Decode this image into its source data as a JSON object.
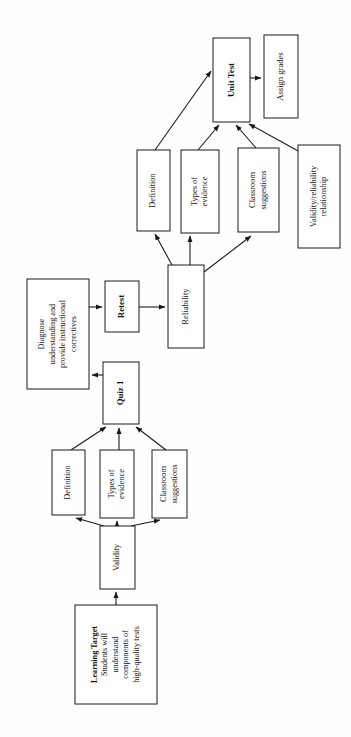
{
  "diagram": {
    "orientation": "rotated-90-counterclockwise",
    "style": {
      "box_fill": "#ffffff",
      "box_stroke": "#1a1a1a",
      "edge_color": "#1a1a1a",
      "text_color": "#111111",
      "page_background": "#fefefe"
    },
    "nodes": [
      {
        "id": "learning-target",
        "lines": [
          "Learning Target",
          "Students will",
          "understand",
          "components of",
          "high-quality tests"
        ],
        "bold_lines": [
          0
        ],
        "x": 75,
        "y": 605,
        "w": 82,
        "h": 99,
        "font_size": 8.2
      },
      {
        "id": "validity",
        "lines": [
          "Validity"
        ],
        "bold_lines": [],
        "x": 100,
        "y": 526,
        "w": 35,
        "h": 63,
        "font_size": 8.6
      },
      {
        "id": "definition-lower",
        "lines": [
          "Definition"
        ],
        "bold_lines": [],
        "x": 52,
        "y": 450,
        "w": 33,
        "h": 65,
        "font_size": 8.4
      },
      {
        "id": "types-of-evidence-lower",
        "lines": [
          "Types of",
          "evidence"
        ],
        "bold_lines": [],
        "x": 100,
        "y": 450,
        "w": 34,
        "h": 68,
        "font_size": 8.4
      },
      {
        "id": "classroom-suggestions-lower",
        "lines": [
          "Classroom",
          "suggestions"
        ],
        "bold_lines": [],
        "x": 152,
        "y": 450,
        "w": 35,
        "h": 68,
        "font_size": 8.4
      },
      {
        "id": "quiz-1",
        "lines": [
          "Quiz 1"
        ],
        "bold_lines": [
          0
        ],
        "x": 103,
        "y": 362,
        "w": 36,
        "h": 62,
        "font_size": 8.8
      },
      {
        "id": "diagnose",
        "lines": [
          "Diagnose",
          "understanding and",
          "provide instructional",
          "correctives"
        ],
        "bold_lines": [],
        "x": 27,
        "y": 279,
        "w": 62,
        "h": 110,
        "font_size": 8.2
      },
      {
        "id": "retest",
        "lines": [
          "Retest"
        ],
        "bold_lines": [
          0
        ],
        "x": 105,
        "y": 281,
        "w": 34,
        "h": 51,
        "font_size": 8.8
      },
      {
        "id": "reliability",
        "lines": [
          "Reliability"
        ],
        "bold_lines": [],
        "x": 168,
        "y": 265,
        "w": 36,
        "h": 83,
        "font_size": 8.6
      },
      {
        "id": "definition-upper",
        "lines": [
          "Definition"
        ],
        "bold_lines": [],
        "x": 137,
        "y": 150,
        "w": 33,
        "h": 81,
        "font_size": 8.4
      },
      {
        "id": "types-of-evidence-upper",
        "lines": [
          "Types of",
          "evidence"
        ],
        "bold_lines": [],
        "x": 181,
        "y": 150,
        "w": 38,
        "h": 83,
        "font_size": 8.4
      },
      {
        "id": "classroom-suggestions-upper",
        "lines": [
          "Classroom",
          "suggestions"
        ],
        "bold_lines": [],
        "x": 238,
        "y": 148,
        "w": 41,
        "h": 84,
        "font_size": 8.4
      },
      {
        "id": "validity-reliability-relationship",
        "lines": [
          "Validity/reliability",
          "relationship"
        ],
        "bold_lines": [],
        "x": 298,
        "y": 145,
        "w": 42,
        "h": 103,
        "font_size": 8.4
      },
      {
        "id": "unit-test",
        "lines": [
          "Unit Test"
        ],
        "bold_lines": [
          0
        ],
        "x": 213,
        "y": 38,
        "w": 37,
        "h": 84,
        "font_size": 8.8
      },
      {
        "id": "assign-grades",
        "lines": [
          "Assign grades"
        ],
        "bold_lines": [],
        "x": 264,
        "y": 35,
        "w": 34,
        "h": 83,
        "font_size": 8.6
      }
    ],
    "edges": [
      {
        "from": "learning-target",
        "to": "validity",
        "points": "116,605 116,592",
        "label": ""
      },
      {
        "from": "validity",
        "to": "definition-lower",
        "points": "104,526 76,518",
        "label": ""
      },
      {
        "from": "validity",
        "to": "types-of-evidence-lower",
        "points": "117,526 117,521",
        "label": ""
      },
      {
        "from": "validity",
        "to": "classroom-suggestions-lower",
        "points": "131,526 160,520",
        "label": ""
      },
      {
        "from": "definition-lower",
        "to": "quiz-1",
        "points": "71,450 106,427",
        "label": ""
      },
      {
        "from": "types-of-evidence-lower",
        "to": "quiz-1",
        "points": "119,450 119,428",
        "label": ""
      },
      {
        "from": "classroom-suggestions-lower",
        "to": "quiz-1",
        "points": "166,450 136,427",
        "label": ""
      },
      {
        "from": "quiz-1",
        "to": "diagnose",
        "points": "103,375 92,375",
        "label": ""
      },
      {
        "from": "diagnose",
        "to": "retest",
        "points": "89,307 102,307",
        "label": ""
      },
      {
        "from": "retest",
        "to": "reliability",
        "points": "139,307 165,307",
        "label": ""
      },
      {
        "from": "reliability",
        "to": "definition-upper",
        "points": "172,265 155,234",
        "label": ""
      },
      {
        "from": "reliability",
        "to": "types-of-evidence-upper",
        "points": "190,265 190,236",
        "label": ""
      },
      {
        "from": "reliability",
        "to": "classroom-suggestions-upper",
        "points": "204,272 251,236",
        "label": ""
      },
      {
        "from": "definition-upper",
        "to": "unit-test",
        "points": "155,150 211,71",
        "label": ""
      },
      {
        "from": "types-of-evidence-upper",
        "to": "unit-test",
        "points": "198,150 219,125",
        "label": ""
      },
      {
        "from": "classroom-suggestions-upper",
        "to": "unit-test",
        "points": "256,148 236,125",
        "label": ""
      },
      {
        "from": "validity-reliability-relationship",
        "to": "unit-test",
        "points": "300,152 249,124",
        "label": ""
      },
      {
        "from": "unit-test",
        "to": "assign-grades",
        "points": "250,78 261,78",
        "label": ""
      }
    ]
  }
}
